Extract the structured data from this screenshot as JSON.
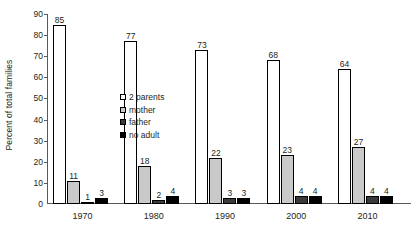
{
  "chart_data": {
    "type": "bar",
    "title": "",
    "subtitle": "",
    "xlabel": "",
    "ylabel": "Percent of total families",
    "categories": [
      "1970",
      "1980",
      "1990",
      "2000",
      "2010"
    ],
    "series": [
      {
        "name": "2 parents",
        "values": [
          85,
          77,
          73,
          68,
          64
        ],
        "color": "#ffffff"
      },
      {
        "name": "mother",
        "values": [
          11,
          18,
          22,
          23,
          27
        ],
        "color": "#c9c9c9"
      },
      {
        "name": "father",
        "values": [
          1,
          2,
          3,
          4,
          4
        ],
        "color": "#3a3a3a"
      },
      {
        "name": "no adult",
        "values": [
          3,
          4,
          3,
          4,
          4
        ],
        "color": "#000000"
      }
    ],
    "ylim": [
      0,
      90
    ],
    "yticks": [
      0,
      10,
      20,
      30,
      40,
      50,
      60,
      70,
      80,
      90
    ],
    "ytick_labels": [
      "0",
      "10",
      "20",
      "30",
      "40",
      "50",
      "60",
      "70",
      "80",
      "90"
    ],
    "grid": false,
    "legend_position": "inside-upper-left",
    "show_value_labels": true,
    "axis_color": "#58595b",
    "text_color": "#231f20",
    "bar_outline_color": "#000000"
  }
}
